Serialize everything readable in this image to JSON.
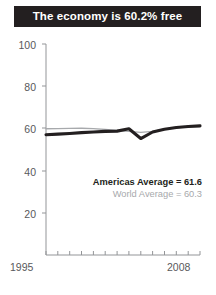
{
  "title": {
    "text": "The economy is 60.2% free"
  },
  "legend": {
    "americas_label": "Americas Average = 61.6",
    "world_label": "World Average = 60.3"
  },
  "axis": {
    "y_ticks": [
      "100",
      "80",
      "60",
      "40",
      "20"
    ],
    "x_start": "1995",
    "x_end": "2008"
  },
  "colors": {
    "banner_bg": "#231f20",
    "banner_text": "#ffffff",
    "americas_line": "#231f20",
    "world_line": "#a7a9ac",
    "axis": "#939598",
    "tick_text": "#58595b"
  },
  "chart_data": {
    "type": "line",
    "title": "The economy is 60.2% free",
    "xlabel": "",
    "ylabel": "",
    "x": [
      1995,
      1996,
      1997,
      1998,
      1999,
      2000,
      2001,
      2002,
      2003,
      2004,
      2005,
      2006,
      2007,
      2008
    ],
    "xlim": [
      1995,
      2008
    ],
    "ylim": [
      0,
      100
    ],
    "yticks": [
      20,
      40,
      60,
      80,
      100
    ],
    "grid": false,
    "legend_position": "inside-right",
    "series": [
      {
        "name": "Americas Average",
        "average": 61.6,
        "color": "#231f20",
        "width": "thick",
        "values": [
          57.0,
          57.3,
          57.6,
          58.0,
          58.3,
          58.6,
          58.7,
          59.8,
          55.2,
          58.3,
          59.6,
          60.4,
          60.9,
          61.2
        ]
      },
      {
        "name": "World Average",
        "average": 60.3,
        "color": "#a7a9ac",
        "width": "thin",
        "values": [
          59.8,
          59.9,
          60.0,
          60.1,
          59.9,
          59.5,
          59.0,
          58.6,
          58.1,
          58.6,
          59.6,
          60.3,
          60.7,
          61.0
        ]
      }
    ],
    "annotations": [
      "Americas Average = 61.6",
      "World Average = 60.3"
    ]
  }
}
